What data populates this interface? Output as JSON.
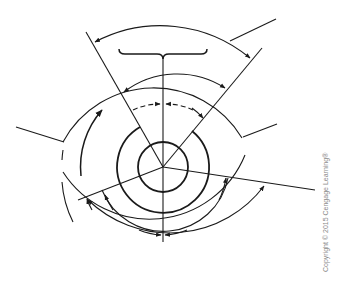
{
  "diagram": {
    "stroke_color": "#1a1a1a",
    "background_color": "#ffffff"
  },
  "footer": {
    "copyright": "Copyright © 2015 Cengage Learning®"
  }
}
